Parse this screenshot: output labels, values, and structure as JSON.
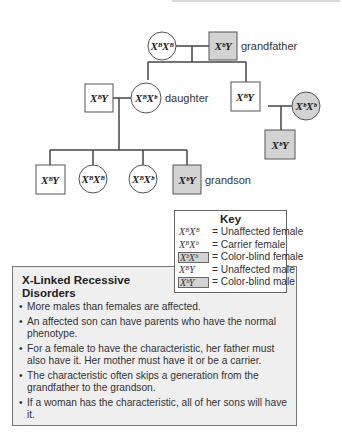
{
  "pedigree": {
    "generation1": {
      "grandmother": {
        "genotype": "XᴮXᴮ",
        "sex": "female",
        "affected": false
      },
      "grandfather": {
        "genotype": "XᵇY",
        "sex": "male",
        "affected": true,
        "label": "grandfather"
      }
    },
    "generation2": {
      "daughter_husband": {
        "genotype": "XᴮY",
        "sex": "male",
        "affected": false
      },
      "daughter": {
        "genotype": "XᴮXᵇ",
        "sex": "female",
        "affected": false,
        "label": "daughter"
      },
      "son": {
        "genotype": "XᴮY",
        "sex": "male",
        "affected": false
      },
      "son_wife": {
        "genotype": "XᵇXᵇ",
        "sex": "female",
        "affected": true
      }
    },
    "generation3": {
      "grandchild1": {
        "genotype": "XᴮY",
        "sex": "male",
        "affected": false
      },
      "grandchild2": {
        "genotype": "XᴮXᴮ",
        "sex": "female",
        "affected": false
      },
      "grandchild3": {
        "genotype": "XᴮXᵇ",
        "sex": "female",
        "affected": false
      },
      "grandson": {
        "genotype": "XᵇY",
        "sex": "male",
        "affected": true,
        "label": "grandson"
      },
      "son_child": {
        "genotype": "XᵇY",
        "sex": "male",
        "affected": true
      }
    }
  },
  "key": {
    "title": "Key",
    "rows": [
      {
        "symbol": "XᴮXᴮ",
        "eq": "=",
        "meaning": "Unaffected female",
        "shaded": false
      },
      {
        "symbol": "XᴮXᵇ",
        "eq": "=",
        "meaning": "Carrier female",
        "shaded": false
      },
      {
        "symbol": "XᵇXᵇ",
        "eq": "=",
        "meaning": "Color-blind female",
        "shaded": true
      },
      {
        "symbol": "XᴮY",
        "eq": "=",
        "meaning": "Unaffected male",
        "shaded": false
      },
      {
        "symbol": "XᵇY",
        "eq": "=",
        "meaning": "Color-blind male",
        "shaded": true
      }
    ]
  },
  "info_box": {
    "title": "X-Linked Recessive Disorders",
    "bullets": [
      "More males than females are affected.",
      "An affected son can have parents who have the normal phenotype.",
      "For a female to have the characteristic, her father must also have it. Her mother must have it or be a carrier.",
      "The characteristic often skips a generation from the grandfather to the grandson.",
      "If a woman has the characteristic, all of her sons will have it."
    ]
  },
  "colors": {
    "affected_fill": "#d3d3d3",
    "unaffected_fill": "#ffffff",
    "box_background": "#efefef",
    "line": "#444444"
  }
}
